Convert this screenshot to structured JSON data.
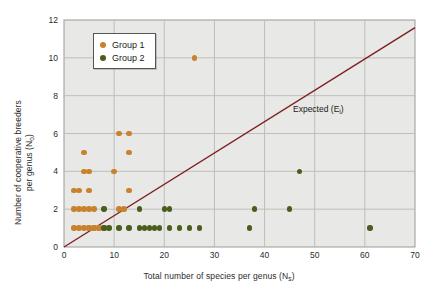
{
  "chart_data": {
    "type": "scatter",
    "title": "",
    "xlabel": "Total number of species per genus (Ns)",
    "xlabel_main": "Total number of species per genus (N",
    "xlabel_sub": "s",
    "xlabel_tail": ")",
    "ylabel_line1": "Number of cooperative breeders",
    "ylabel_line2_main": "per genus (N",
    "ylabel_line2_sub": "o",
    "ylabel_line2_tail": ")",
    "xlim": [
      0,
      70
    ],
    "ylim": [
      0,
      12
    ],
    "xticks": [
      0,
      10,
      20,
      30,
      40,
      50,
      60,
      70
    ],
    "yticks": [
      0,
      2,
      4,
      6,
      8,
      10,
      12
    ],
    "grid": true,
    "legend_position": "upper-left-inside",
    "plot_bgcolor": "#e8e8e6",
    "grid_color": "#b9b9b5",
    "series": [
      {
        "name": "Group 1",
        "color": "#c8822d",
        "points": [
          [
            2,
            1
          ],
          [
            3,
            1
          ],
          [
            4,
            1
          ],
          [
            5,
            1
          ],
          [
            5,
            1
          ],
          [
            6,
            1
          ],
          [
            6,
            1
          ],
          [
            7,
            1
          ],
          [
            7,
            1
          ],
          [
            8,
            1
          ],
          [
            2,
            2
          ],
          [
            3,
            2
          ],
          [
            4,
            2
          ],
          [
            5,
            2
          ],
          [
            6,
            2
          ],
          [
            11,
            2
          ],
          [
            12,
            2
          ],
          [
            2,
            3
          ],
          [
            3,
            3
          ],
          [
            5,
            3
          ],
          [
            13,
            3
          ],
          [
            4,
            4
          ],
          [
            5,
            4
          ],
          [
            10,
            4
          ],
          [
            4,
            5
          ],
          [
            13,
            5
          ],
          [
            11,
            6
          ],
          [
            13,
            6
          ],
          [
            26,
            10
          ]
        ]
      },
      {
        "name": "Group 2",
        "color": "#4a5d1c",
        "points": [
          [
            8,
            1
          ],
          [
            9,
            1
          ],
          [
            11,
            1
          ],
          [
            13,
            1
          ],
          [
            15,
            1
          ],
          [
            16,
            1
          ],
          [
            17,
            1
          ],
          [
            18,
            1
          ],
          [
            19,
            1
          ],
          [
            21,
            1
          ],
          [
            23,
            1
          ],
          [
            25,
            1
          ],
          [
            27,
            1
          ],
          [
            37,
            1
          ],
          [
            61,
            1
          ],
          [
            8,
            2
          ],
          [
            15,
            2
          ],
          [
            20,
            2
          ],
          [
            21,
            2
          ],
          [
            38,
            2
          ],
          [
            45,
            2
          ],
          [
            47,
            4
          ]
        ]
      }
    ],
    "reference_line": {
      "label_main": "Expected (E",
      "label_sub": "i",
      "label_tail": ")",
      "color": "#7d1f22",
      "x_start": 0,
      "y_start": 0,
      "x_end": 70,
      "y_end": 11.6
    }
  },
  "legend": {
    "entries": [
      {
        "label": "Group 1",
        "color": "#c8822d"
      },
      {
        "label": "Group 2",
        "color": "#4a5d1c"
      }
    ]
  }
}
